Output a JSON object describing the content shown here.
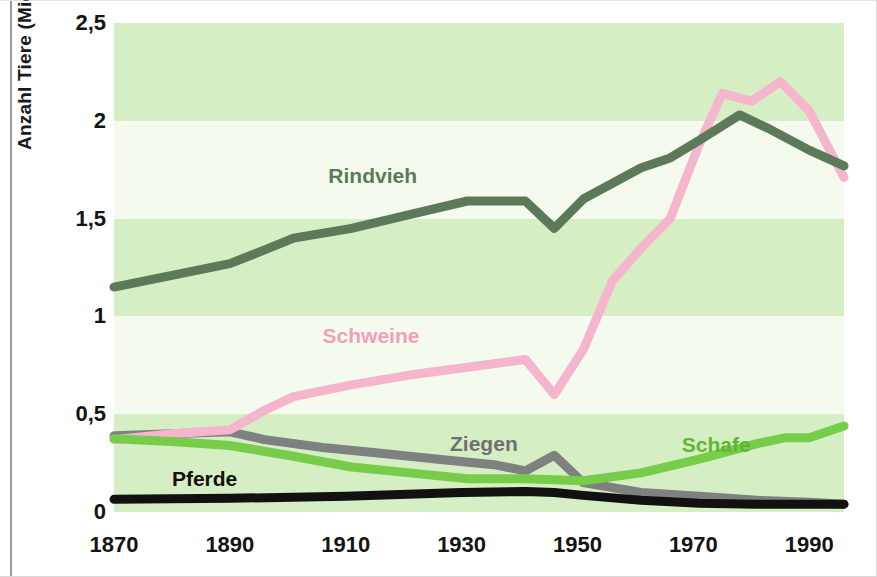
{
  "chart_data": {
    "type": "line",
    "title": "",
    "xlabel": "",
    "ylabel": "Anzahl Tiere (Mio.)",
    "xlim": [
      1870,
      1996
    ],
    "ylim": [
      0,
      2.5
    ],
    "xticks": [
      1870,
      1890,
      1910,
      1930,
      1950,
      1970,
      1990
    ],
    "xticklabels": [
      "1870",
      "1890",
      "1910",
      "1930",
      "1950",
      "1970",
      "1990"
    ],
    "yticks": [
      0,
      0.5,
      1,
      1.5,
      2,
      2.5
    ],
    "yticklabels": [
      "0",
      "0,5",
      "1",
      "1,5",
      "2",
      "2,5"
    ],
    "grid": false,
    "background_bands": true,
    "legend": "inline-labels",
    "series": [
      {
        "name": "Rindvieh",
        "color": "#5c7a59",
        "label_color": "#5c7a59",
        "label_x": 1907,
        "label_y": 1.72,
        "x": [
          1870,
          1880,
          1890,
          1896,
          1901,
          1911,
          1921,
          1931,
          1941,
          1946,
          1951,
          1961,
          1966,
          1971,
          1978,
          1983,
          1990,
          1996
        ],
        "values": [
          1.15,
          1.21,
          1.27,
          1.34,
          1.4,
          1.45,
          1.52,
          1.59,
          1.59,
          1.45,
          1.6,
          1.76,
          1.81,
          1.9,
          2.03,
          1.96,
          1.85,
          1.77
        ]
      },
      {
        "name": "Schweine",
        "color": "#f4b5cd",
        "label_color": "#f0a0bd",
        "label_x": 1906,
        "label_y": 0.9,
        "x": [
          1870,
          1880,
          1890,
          1896,
          1901,
          1911,
          1921,
          1931,
          1941,
          1946,
          1951,
          1956,
          1961,
          1966,
          1971,
          1975,
          1980,
          1985,
          1990,
          1996
        ],
        "values": [
          0.37,
          0.4,
          0.42,
          0.52,
          0.59,
          0.65,
          0.7,
          0.74,
          0.78,
          0.6,
          0.83,
          1.18,
          1.35,
          1.5,
          1.88,
          2.14,
          2.1,
          2.2,
          2.05,
          1.71
        ]
      },
      {
        "name": "Ziegen",
        "color": "#7f8080",
        "label_color": "#6e7070",
        "label_x": 1928,
        "label_y": 0.35,
        "x": [
          1870,
          1880,
          1890,
          1896,
          1906,
          1916,
          1926,
          1936,
          1941,
          1946,
          1951,
          1961,
          1971,
          1981,
          1990,
          1996
        ],
        "values": [
          0.39,
          0.4,
          0.41,
          0.37,
          0.33,
          0.3,
          0.27,
          0.24,
          0.21,
          0.29,
          0.15,
          0.1,
          0.08,
          0.06,
          0.05,
          0.04
        ]
      },
      {
        "name": "Schafe",
        "color": "#77cc4a",
        "label_color": "#5cb82e",
        "label_x": 1968,
        "label_y": 0.34,
        "x": [
          1870,
          1880,
          1890,
          1900,
          1911,
          1921,
          1931,
          1941,
          1951,
          1961,
          1971,
          1981,
          1986,
          1990,
          1996
        ],
        "values": [
          0.375,
          0.36,
          0.34,
          0.29,
          0.23,
          0.2,
          0.17,
          0.17,
          0.16,
          0.2,
          0.27,
          0.35,
          0.38,
          0.38,
          0.44
        ]
      },
      {
        "name": "Pferde",
        "color": "#111111",
        "label_color": "#111111",
        "label_x": 1880,
        "label_y": 0.17,
        "x": [
          1870,
          1890,
          1910,
          1930,
          1941,
          1946,
          1951,
          1961,
          1971,
          1981,
          1990,
          1996
        ],
        "values": [
          0.065,
          0.07,
          0.08,
          0.1,
          0.105,
          0.1,
          0.085,
          0.06,
          0.045,
          0.04,
          0.04,
          0.04
        ]
      }
    ],
    "band_color_dark": "#d6eec3",
    "band_color_light": "#f4fbee",
    "bands": [
      {
        "from": 2.0,
        "to": 2.5,
        "shade": "dark"
      },
      {
        "from": 1.5,
        "to": 2.0,
        "shade": "light"
      },
      {
        "from": 1.0,
        "to": 1.5,
        "shade": "dark"
      },
      {
        "from": 0.5,
        "to": 1.0,
        "shade": "light"
      },
      {
        "from": 0.0,
        "to": 0.5,
        "shade": "dark"
      }
    ]
  }
}
